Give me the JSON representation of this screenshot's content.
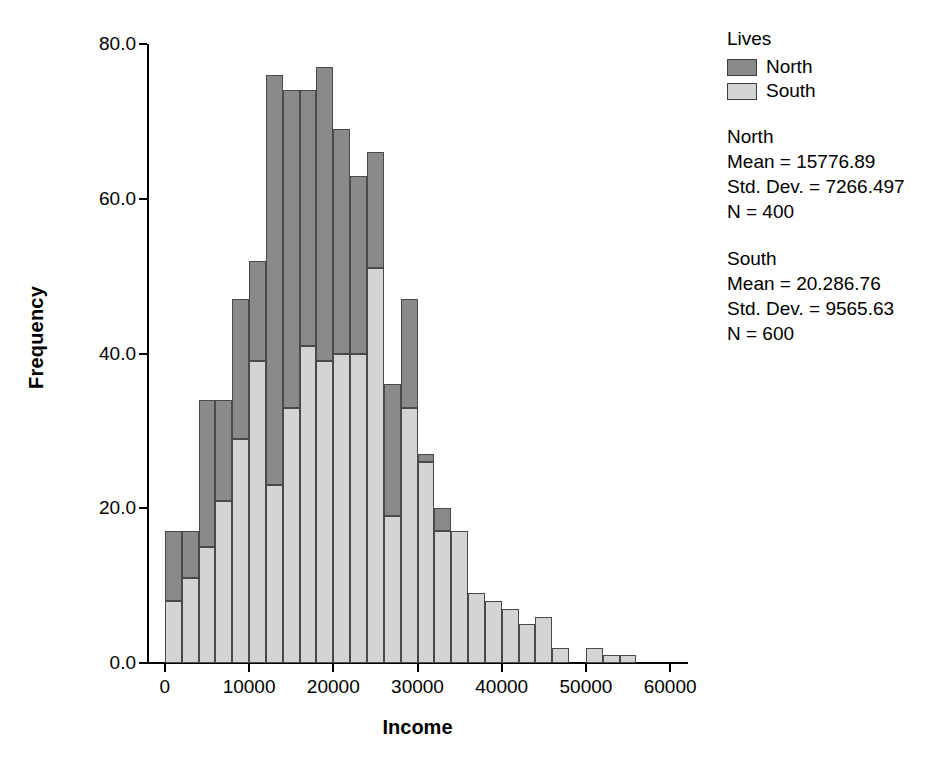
{
  "chart_data": {
    "type": "bar",
    "subtype": "stacked-histogram",
    "title": "",
    "xlabel": "Income",
    "ylabel": "Frequency",
    "xlim": [
      -2000,
      62000
    ],
    "ylim": [
      0,
      80
    ],
    "x_ticks": [
      "0",
      "10000",
      "20000",
      "30000",
      "40000",
      "50000",
      "60000"
    ],
    "x_tick_values": [
      0,
      10000,
      20000,
      30000,
      40000,
      50000,
      60000
    ],
    "y_ticks": [
      "0.0",
      "20.0",
      "40.0",
      "60.0",
      "80.0"
    ],
    "y_tick_values": [
      0,
      20,
      40,
      60,
      80
    ],
    "grid": false,
    "legend_position": "right",
    "bin_width": 2000,
    "bin_starts": [
      0,
      2000,
      4000,
      6000,
      8000,
      10000,
      12000,
      14000,
      16000,
      18000,
      20000,
      22000,
      24000,
      26000,
      28000,
      30000,
      32000,
      34000,
      36000,
      38000,
      40000,
      42000,
      44000,
      46000,
      48000,
      50000,
      52000,
      54000
    ],
    "series": [
      {
        "name": "South",
        "color": "#d4d4d4",
        "values": [
          8,
          11,
          15,
          21,
          29,
          39,
          23,
          33,
          41,
          39,
          40,
          40,
          51,
          19,
          33,
          26,
          17,
          17,
          9,
          8,
          7,
          5,
          6,
          2,
          0,
          2,
          1,
          1
        ]
      },
      {
        "name": "North",
        "color": "#8a8a8a",
        "values": [
          9,
          6,
          19,
          13,
          18,
          13,
          53,
          41,
          33,
          38,
          29,
          23,
          15,
          17,
          14,
          1,
          3,
          0,
          0,
          0,
          0,
          0,
          0,
          0,
          0,
          0,
          0,
          0
        ]
      }
    ],
    "totals": [
      17,
      17,
      34,
      34,
      47,
      52,
      76,
      74,
      74,
      77,
      69,
      63,
      66,
      36,
      47,
      27,
      20,
      17,
      9,
      8,
      7,
      5,
      6,
      2,
      0,
      2,
      1,
      1
    ]
  },
  "legend": {
    "title": "Lives",
    "entries": [
      {
        "label": "North",
        "color": "#8a8a8a"
      },
      {
        "label": "South",
        "color": "#d4d4d4"
      }
    ]
  },
  "stats": [
    {
      "group": "North",
      "mean_line": "Mean = 15776.89",
      "std_line": "Std. Dev. = 7266.497",
      "n_line": "N = 400"
    },
    {
      "group": "South",
      "mean_line": "Mean = 20.286.76",
      "std_line": "Std. Dev. = 9565.63",
      "n_line": "N = 600"
    }
  ],
  "axes": {
    "x_title": "Income",
    "y_title": "Frequency"
  }
}
